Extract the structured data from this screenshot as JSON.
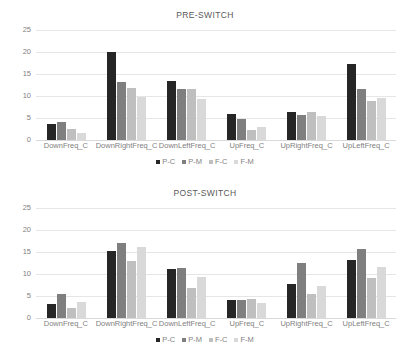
{
  "charts": [
    {
      "title": "PRE-SWITCH",
      "legend_position": "bottom-center"
    },
    {
      "title": "POST-SWITCH",
      "legend_position": "bottom-center"
    }
  ],
  "series_colors": {
    "P-C": "#262626",
    "P-M": "#7f7f7f",
    "F-C": "#bfbfbf",
    "F-M": "#d9d9d9"
  },
  "axis": {
    "yticks": [
      "25",
      "20",
      "15",
      "10",
      "5",
      "0"
    ],
    "ymin": 0,
    "ymax": 25,
    "grid": true
  },
  "legend": [
    {
      "label": "P-C",
      "color": "#262626"
    },
    {
      "label": "P-M",
      "color": "#7f7f7f"
    },
    {
      "label": "F-C",
      "color": "#bfbfbf"
    },
    {
      "label": "F-M",
      "color": "#d9d9d9"
    }
  ],
  "chart_data": [
    {
      "type": "bar",
      "title": "PRE-SWITCH",
      "xlabel": "",
      "ylabel": "",
      "ylim": [
        0,
        25
      ],
      "yticks": [
        0,
        5,
        10,
        15,
        20,
        25
      ],
      "grid": true,
      "legend_position": "bottom-center",
      "categories": [
        "DownFreq_C",
        "DownRightFreq_C",
        "DownLeftFreq_C",
        "UpFreq_C",
        "UpRightFreq_C",
        "UpLeftFreq_C"
      ],
      "series": [
        {
          "name": "P-C",
          "values": [
            3.7,
            19.9,
            13.3,
            5.8,
            6.3,
            17.2
          ]
        },
        {
          "name": "P-M",
          "values": [
            4.1,
            13.2,
            11.7,
            4.8,
            5.7,
            11.5
          ]
        },
        {
          "name": "F-C",
          "values": [
            2.5,
            11.9,
            11.7,
            2.2,
            6.4,
            8.9
          ]
        },
        {
          "name": "F-M",
          "values": [
            1.5,
            9.8,
            9.4,
            3.0,
            5.5,
            9.5
          ]
        }
      ]
    },
    {
      "type": "bar",
      "title": "POST-SWITCH",
      "xlabel": "",
      "ylabel": "",
      "ylim": [
        0,
        25
      ],
      "yticks": [
        0,
        5,
        10,
        15,
        20,
        25
      ],
      "grid": true,
      "legend_position": "bottom-center",
      "categories": [
        "DownFreq_C",
        "DownRightFreq_C",
        "DownLeftFreq_C",
        "UpFreq_C",
        "UpRightFreq_C",
        "UpLeftFreq_C"
      ],
      "series": [
        {
          "name": "P-C",
          "values": [
            3.1,
            15.2,
            11.1,
            4.1,
            7.8,
            13.1
          ]
        },
        {
          "name": "P-M",
          "values": [
            5.5,
            17.1,
            11.4,
            4.2,
            12.6,
            15.7
          ]
        },
        {
          "name": "F-C",
          "values": [
            2.3,
            12.9,
            6.8,
            4.3,
            5.5,
            9.2
          ]
        },
        {
          "name": "F-M",
          "values": [
            3.7,
            16.1,
            9.4,
            3.3,
            7.2,
            11.7
          ]
        }
      ]
    }
  ]
}
